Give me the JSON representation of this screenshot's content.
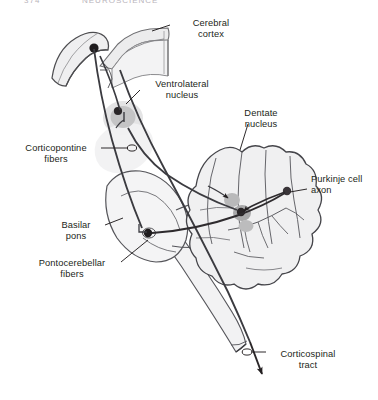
{
  "figure": {
    "background": "#ffffff",
    "ink": "#231f20",
    "fill_light": "#f0f0f1",
    "fill_mid": "#d9d9da",
    "fill_nucleus": "#b8b8b9"
  },
  "header": {
    "left_fragment": "374",
    "right_fragment": "NEUROSCIENCE"
  },
  "labels": [
    {
      "key": "cerebral_cortex",
      "text": "Cerebral\ncortex",
      "x": 174,
      "y": 18,
      "w": 74
    },
    {
      "key": "ventrolateral_nucleus",
      "text": "Ventrolateral\nnucleus",
      "x": 141,
      "y": 79,
      "w": 82
    },
    {
      "key": "dentate_nucleus",
      "text": "Dentate\nnucleus",
      "x": 228,
      "y": 108,
      "w": 66
    },
    {
      "key": "corticopontine_fibers",
      "text": "Corticopontine\nfibers",
      "x": 12,
      "y": 143,
      "w": 88
    },
    {
      "key": "purkinje_cell_axon",
      "text": "Purkinje cell\naxon",
      "x": 311,
      "y": 174,
      "w": 70
    },
    {
      "key": "basilar_pons",
      "text": "Basilar\npons",
      "x": 48,
      "y": 220,
      "w": 56
    },
    {
      "key": "pontocerebellar_fibers",
      "text": "Pontocerebellar\nfibers",
      "x": 24,
      "y": 258,
      "w": 96
    },
    {
      "key": "corticospinal_tract",
      "text": "Corticospinal\ntract",
      "x": 269,
      "y": 349,
      "w": 78
    }
  ],
  "structures": [
    {
      "key": "cerebral-cortex-slab",
      "name": "Cerebral cortex"
    },
    {
      "key": "thalamus",
      "name": "Thalamus"
    },
    {
      "key": "ventrolateral-nucleus",
      "name": "Ventrolateral nucleus"
    },
    {
      "key": "basilar-pons",
      "name": "Basilar pons"
    },
    {
      "key": "cerebellum",
      "name": "Cerebellum"
    },
    {
      "key": "dentate-nucleus",
      "name": "Dentate nucleus"
    },
    {
      "key": "medulla",
      "name": "Medulla / brainstem"
    }
  ],
  "pathways": [
    {
      "key": "corticopontine",
      "name": "Corticopontine fibers"
    },
    {
      "key": "pontocerebellar",
      "name": "Pontocerebellar fibers"
    },
    {
      "key": "purkinje-axon",
      "name": "Purkinje cell axon"
    },
    {
      "key": "dentatothalamic",
      "name": "Dentate to ventrolateral nucleus"
    },
    {
      "key": "corticospinal",
      "name": "Corticospinal tract"
    }
  ]
}
